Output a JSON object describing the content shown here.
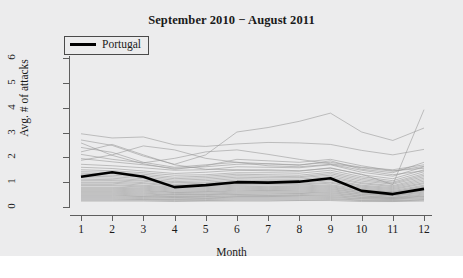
{
  "chart_data": {
    "type": "line",
    "title": "September 2010 − August 2011",
    "xlabel": "Month",
    "ylabel": "Avg. # of attacks",
    "xlim": [
      1,
      12
    ],
    "ylim": [
      0,
      6.2
    ],
    "grid": false,
    "legend_position": "top-left",
    "x": [
      1,
      2,
      3,
      4,
      5,
      6,
      7,
      8,
      9,
      10,
      11,
      12
    ],
    "xticks": [
      "1",
      "2",
      "3",
      "4",
      "5",
      "6",
      "7",
      "8",
      "9",
      "10",
      "11",
      "12"
    ],
    "yticks": [
      "0",
      "1",
      "2",
      "3",
      "4",
      "5",
      "6"
    ],
    "highlight_color": "#000000",
    "background_color": "#ececed",
    "other_series_color": "#9a9a9a",
    "series": [
      {
        "name": "Portugal",
        "highlighted": true,
        "values": [
          1.22,
          1.4,
          1.22,
          0.8,
          0.88,
          1.0,
          0.98,
          1.02,
          1.16,
          0.65,
          0.52,
          0.73
        ]
      },
      {
        "name": "country-01",
        "highlighted": false,
        "values": [
          2.95,
          2.78,
          2.82,
          2.5,
          2.44,
          2.54,
          2.6,
          2.58,
          2.52,
          2.28,
          2.1,
          2.32
        ]
      },
      {
        "name": "country-02",
        "highlighted": false,
        "values": [
          2.7,
          2.48,
          2.05,
          1.72,
          2.1,
          3.02,
          3.2,
          3.45,
          3.78,
          3.02,
          2.68,
          3.18
        ]
      },
      {
        "name": "country-03",
        "highlighted": false,
        "values": [
          2.22,
          2.52,
          2.1,
          1.7,
          1.52,
          1.5,
          1.5,
          1.46,
          1.56,
          1.32,
          0.9,
          3.92
        ]
      },
      {
        "name": "country-04",
        "highlighted": false,
        "values": [
          1.95,
          1.82,
          1.7,
          1.56,
          1.62,
          1.72,
          1.74,
          1.68,
          1.86,
          1.52,
          1.38,
          1.8
        ]
      },
      {
        "name": "country-05",
        "highlighted": false,
        "values": [
          1.72,
          1.66,
          1.58,
          1.48,
          1.5,
          1.62,
          1.6,
          1.58,
          1.7,
          1.4,
          1.24,
          1.62
        ]
      },
      {
        "name": "country-06",
        "highlighted": false,
        "values": [
          1.6,
          1.55,
          1.45,
          1.35,
          1.4,
          1.48,
          1.46,
          1.44,
          1.58,
          1.3,
          1.14,
          1.5
        ]
      },
      {
        "name": "country-07",
        "highlighted": false,
        "values": [
          1.5,
          1.46,
          1.38,
          1.28,
          1.3,
          1.38,
          1.38,
          1.36,
          1.48,
          1.22,
          1.06,
          1.42
        ]
      },
      {
        "name": "country-08",
        "highlighted": false,
        "values": [
          1.42,
          1.4,
          1.32,
          1.2,
          1.24,
          1.32,
          1.3,
          1.28,
          1.4,
          1.16,
          1.0,
          1.34
        ]
      },
      {
        "name": "country-09",
        "highlighted": false,
        "values": [
          1.36,
          1.34,
          1.26,
          1.14,
          1.18,
          1.26,
          1.24,
          1.22,
          1.34,
          1.1,
          0.96,
          1.28
        ]
      },
      {
        "name": "country-10",
        "highlighted": false,
        "values": [
          1.3,
          1.28,
          1.2,
          1.08,
          1.12,
          1.2,
          1.18,
          1.18,
          1.28,
          1.04,
          0.92,
          1.22
        ]
      },
      {
        "name": "country-11",
        "highlighted": false,
        "values": [
          1.24,
          1.22,
          1.14,
          1.02,
          1.06,
          1.14,
          1.12,
          1.12,
          1.22,
          0.98,
          0.86,
          1.16
        ]
      },
      {
        "name": "country-12",
        "highlighted": false,
        "values": [
          1.18,
          1.16,
          1.08,
          0.98,
          1.0,
          1.08,
          1.06,
          1.06,
          1.16,
          0.94,
          0.82,
          1.1
        ]
      },
      {
        "name": "country-13",
        "highlighted": false,
        "values": [
          1.12,
          1.1,
          1.04,
          0.92,
          0.96,
          1.02,
          1.02,
          1.02,
          1.1,
          0.88,
          0.78,
          1.04
        ]
      },
      {
        "name": "country-14",
        "highlighted": false,
        "values": [
          1.06,
          1.06,
          0.98,
          0.88,
          0.9,
          0.98,
          0.96,
          0.96,
          1.06,
          0.84,
          0.74,
          0.98
        ]
      },
      {
        "name": "country-15",
        "highlighted": false,
        "values": [
          1.0,
          1.0,
          0.94,
          0.84,
          0.86,
          0.92,
          0.92,
          0.92,
          1.0,
          0.8,
          0.7,
          0.94
        ]
      },
      {
        "name": "country-16",
        "highlighted": false,
        "values": [
          0.96,
          0.96,
          0.88,
          0.8,
          0.82,
          0.88,
          0.88,
          0.88,
          0.96,
          0.76,
          0.66,
          0.88
        ]
      },
      {
        "name": "country-17",
        "highlighted": false,
        "values": [
          0.9,
          0.9,
          0.84,
          0.76,
          0.78,
          0.84,
          0.82,
          0.84,
          0.9,
          0.72,
          0.62,
          0.84
        ]
      },
      {
        "name": "country-18",
        "highlighted": false,
        "values": [
          0.86,
          0.86,
          0.8,
          0.72,
          0.74,
          0.8,
          0.78,
          0.8,
          0.86,
          0.68,
          0.6,
          0.8
        ]
      },
      {
        "name": "country-19",
        "highlighted": false,
        "values": [
          0.8,
          0.8,
          0.76,
          0.68,
          0.7,
          0.76,
          0.74,
          0.76,
          0.82,
          0.64,
          0.56,
          0.76
        ]
      },
      {
        "name": "country-20",
        "highlighted": false,
        "values": [
          0.76,
          0.76,
          0.72,
          0.64,
          0.66,
          0.72,
          0.7,
          0.72,
          0.78,
          0.62,
          0.54,
          0.72
        ]
      },
      {
        "name": "country-21",
        "highlighted": false,
        "values": [
          0.72,
          0.72,
          0.68,
          0.6,
          0.62,
          0.68,
          0.66,
          0.68,
          0.74,
          0.58,
          0.5,
          0.68
        ]
      },
      {
        "name": "country-22",
        "highlighted": false,
        "values": [
          0.68,
          0.68,
          0.64,
          0.58,
          0.6,
          0.64,
          0.64,
          0.64,
          0.7,
          0.56,
          0.48,
          0.64
        ]
      },
      {
        "name": "country-23",
        "highlighted": false,
        "values": [
          0.64,
          0.64,
          0.6,
          0.54,
          0.56,
          0.6,
          0.6,
          0.6,
          0.66,
          0.52,
          0.46,
          0.6
        ]
      },
      {
        "name": "country-24",
        "highlighted": false,
        "values": [
          0.6,
          0.6,
          0.56,
          0.5,
          0.52,
          0.56,
          0.56,
          0.56,
          0.62,
          0.5,
          0.44,
          0.56
        ]
      },
      {
        "name": "country-25",
        "highlighted": false,
        "values": [
          0.56,
          0.56,
          0.52,
          0.48,
          0.5,
          0.52,
          0.52,
          0.54,
          0.58,
          0.46,
          0.4,
          0.52
        ]
      },
      {
        "name": "country-26",
        "highlighted": false,
        "values": [
          0.52,
          0.52,
          0.48,
          0.44,
          0.46,
          0.5,
          0.48,
          0.5,
          0.54,
          0.44,
          0.38,
          0.48
        ]
      },
      {
        "name": "country-27",
        "highlighted": false,
        "values": [
          0.48,
          0.48,
          0.44,
          0.42,
          0.42,
          0.46,
          0.46,
          0.46,
          0.5,
          0.4,
          0.36,
          0.44
        ]
      },
      {
        "name": "country-28",
        "highlighted": false,
        "values": [
          0.44,
          0.44,
          0.42,
          0.38,
          0.4,
          0.42,
          0.42,
          0.44,
          0.46,
          0.38,
          0.34,
          0.42
        ]
      },
      {
        "name": "country-29",
        "highlighted": false,
        "values": [
          0.4,
          0.4,
          0.38,
          0.36,
          0.36,
          0.4,
          0.4,
          0.4,
          0.42,
          0.34,
          0.32,
          0.38
        ]
      },
      {
        "name": "country-30",
        "highlighted": false,
        "values": [
          0.36,
          0.36,
          0.34,
          0.32,
          0.34,
          0.36,
          0.36,
          0.36,
          0.38,
          0.32,
          0.3,
          0.34
        ]
      },
      {
        "name": "country-31",
        "highlighted": false,
        "values": [
          0.32,
          0.32,
          0.3,
          0.3,
          0.3,
          0.32,
          0.32,
          0.32,
          0.34,
          0.28,
          0.26,
          0.3
        ]
      },
      {
        "name": "country-32",
        "highlighted": false,
        "values": [
          0.28,
          0.28,
          0.28,
          0.26,
          0.26,
          0.28,
          0.28,
          0.28,
          0.3,
          0.26,
          0.24,
          0.28
        ]
      },
      {
        "name": "country-33",
        "highlighted": false,
        "values": [
          0.24,
          0.24,
          0.24,
          0.22,
          0.24,
          0.24,
          0.24,
          0.26,
          0.26,
          0.22,
          0.22,
          0.24
        ]
      },
      {
        "name": "country-34",
        "highlighted": false,
        "values": [
          2.4,
          2.2,
          1.8,
          1.6,
          1.7,
          1.8,
          1.74,
          1.7,
          1.8,
          1.6,
          1.5,
          1.7
        ]
      },
      {
        "name": "country-35",
        "highlighted": false,
        "values": [
          2.58,
          2.08,
          1.74,
          1.52,
          1.66,
          1.92,
          1.86,
          1.8,
          1.92,
          1.66,
          1.46,
          1.56
        ]
      },
      {
        "name": "country-36",
        "highlighted": false,
        "values": [
          1.88,
          2.1,
          2.46,
          2.3,
          1.96,
          1.8,
          1.66,
          1.62,
          1.72,
          1.48,
          1.3,
          1.46
        ]
      },
      {
        "name": "country-37",
        "highlighted": false,
        "values": [
          2.12,
          1.92,
          1.78,
          1.96,
          2.22,
          2.3,
          2.12,
          1.92,
          1.74,
          1.58,
          1.44,
          1.64
        ]
      }
    ]
  },
  "legend": {
    "entries": [
      {
        "label": "Portugal",
        "color": "#000000"
      }
    ]
  },
  "axes": {
    "y_title": "Avg. # of attacks",
    "x_title": "Month"
  }
}
